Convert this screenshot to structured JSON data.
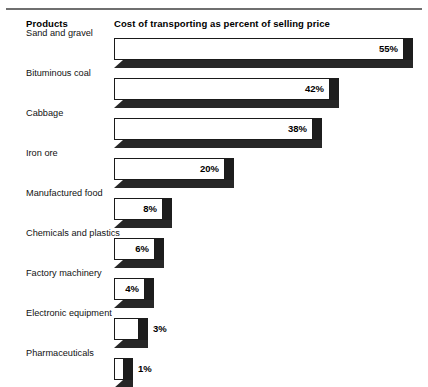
{
  "header": {
    "products_label": "Products",
    "measure_label": "Cost of transporting as percent of selling price"
  },
  "chart_data": {
    "type": "bar",
    "orientation": "horizontal",
    "title": "Cost of transporting as percent of selling price",
    "xlabel": "Cost of transporting as percent of selling price",
    "ylabel": "Products",
    "grid": false,
    "legend": null,
    "value_suffix": "%",
    "categories": [
      "Sand and gravel",
      "Bituminous coal",
      "Cabbage",
      "Iron ore",
      "Manufactured food",
      "Chemicals and plastics",
      "Factory machinery",
      "Electronic equipment",
      "Pharmaceuticals"
    ],
    "values": [
      55,
      42,
      38,
      20,
      8,
      6,
      4,
      3,
      1
    ],
    "value_labels": [
      "55%",
      "42%",
      "38%",
      "20%",
      "8%",
      "6%",
      "4%",
      "3%",
      "1%"
    ],
    "bars": [
      {
        "category": "Sand and gravel",
        "value": 55,
        "label": "55%",
        "bar_px": 290,
        "label_position": "inside"
      },
      {
        "category": "Bituminous coal",
        "value": 42,
        "label": "42%",
        "bar_px": 216,
        "label_position": "inside"
      },
      {
        "category": "Cabbage",
        "value": 38,
        "label": "38%",
        "bar_px": 199,
        "label_position": "inside"
      },
      {
        "category": "Iron ore",
        "value": 20,
        "label": "20%",
        "bar_px": 111,
        "label_position": "inside"
      },
      {
        "category": "Manufactured food",
        "value": 8,
        "label": "8%",
        "bar_px": 49,
        "label_position": "inside"
      },
      {
        "category": "Chemicals and plastics",
        "value": 6,
        "label": "6%",
        "bar_px": 41,
        "label_position": "inside"
      },
      {
        "category": "Factory machinery",
        "value": 4,
        "label": "4%",
        "bar_px": 31,
        "label_position": "inside"
      },
      {
        "category": "Electronic equipment",
        "value": 3,
        "label": "3%",
        "bar_px": 25,
        "label_position": "outside"
      },
      {
        "category": "Pharmaceuticals",
        "value": 1,
        "label": "1%",
        "bar_px": 10,
        "label_position": "outside"
      }
    ]
  },
  "style": {
    "bar_face_color": "#ffffff",
    "bar_outline_color": "#1a1a1a",
    "bar_shadow_color": "#1c1c1c",
    "rule_color": "#6f6f6f",
    "text_color": "#111111"
  }
}
